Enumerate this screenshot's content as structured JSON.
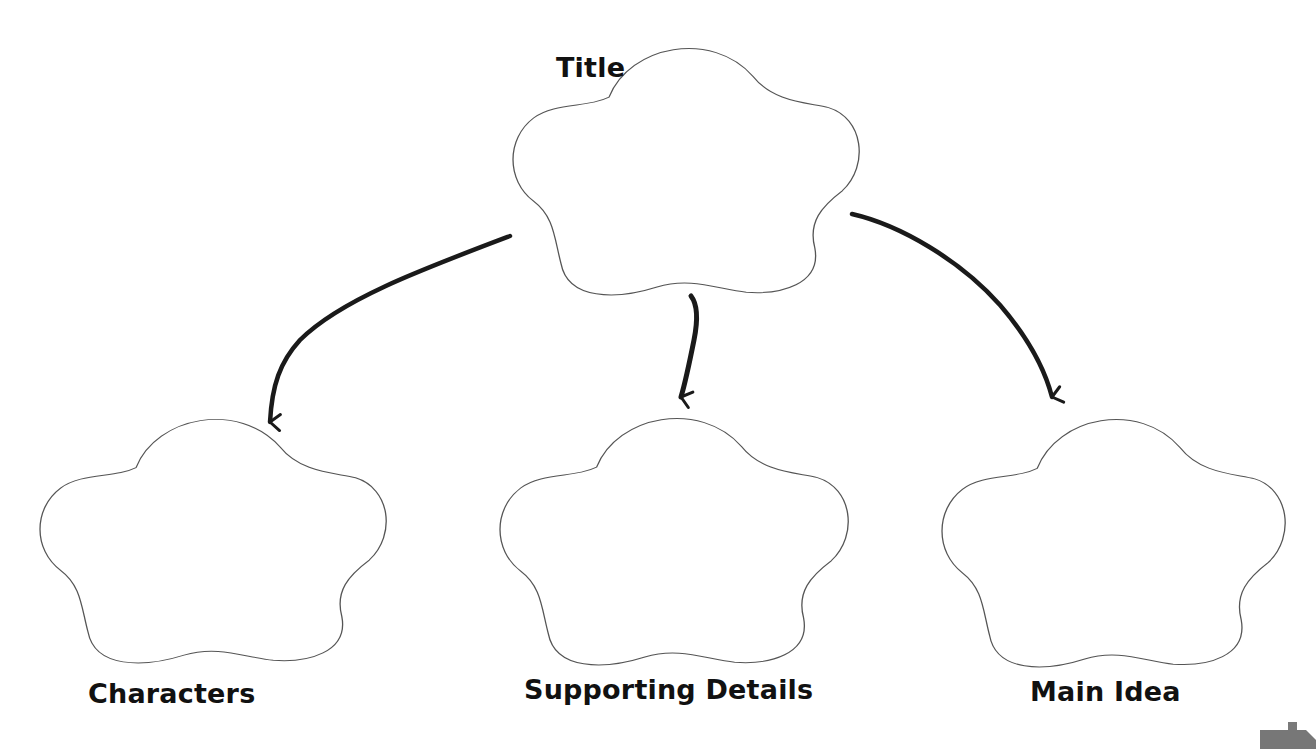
{
  "diagram": {
    "type": "graphic-organizer",
    "colors": {
      "background": "#ffffff",
      "cloud_stroke": "#555555",
      "arrow": "#1a1a1a",
      "label_text": "#111111",
      "corner_tab": "#777777"
    },
    "nodes": [
      {
        "id": "title",
        "label": "Title",
        "shape": "cloud"
      },
      {
        "id": "characters",
        "label": "Characters",
        "shape": "cloud"
      },
      {
        "id": "supporting-details",
        "label": "Supporting Details",
        "shape": "cloud"
      },
      {
        "id": "main-idea",
        "label": "Main Idea",
        "shape": "cloud"
      }
    ],
    "edges": [
      {
        "from": "title",
        "to": "characters"
      },
      {
        "from": "title",
        "to": "supporting-details"
      },
      {
        "from": "title",
        "to": "main-idea"
      }
    ]
  }
}
